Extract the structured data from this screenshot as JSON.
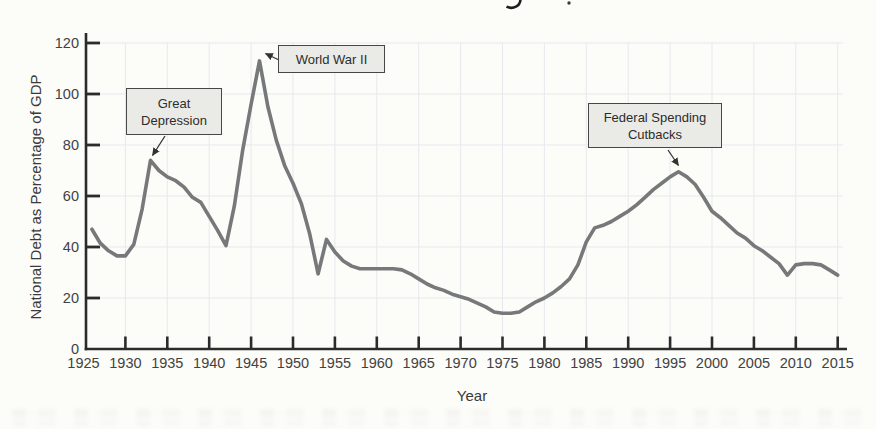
{
  "chart_data": {
    "type": "line",
    "title": "",
    "xlabel": "Year",
    "ylabel": "National Debt as Percentage of GDP",
    "x_ticks": [
      1925,
      1930,
      1935,
      1940,
      1945,
      1950,
      1955,
      1960,
      1965,
      1970,
      1975,
      1980,
      1985,
      1990,
      1995,
      2000,
      2005,
      2010,
      2015
    ],
    "y_ticks": [
      0,
      20,
      40,
      60,
      80,
      100,
      120
    ],
    "xlim": [
      1925,
      2016
    ],
    "ylim": [
      0,
      120
    ],
    "grid": true,
    "legend": "none",
    "series": [
      {
        "name": "National Debt as Percentage of GDP",
        "points": [
          [
            1926,
            47
          ],
          [
            1927,
            41.5
          ],
          [
            1928,
            38.5
          ],
          [
            1929,
            36.5
          ],
          [
            1930,
            36.5
          ],
          [
            1931,
            41
          ],
          [
            1932,
            55
          ],
          [
            1933,
            74
          ],
          [
            1934,
            70
          ],
          [
            1935,
            67.5
          ],
          [
            1936,
            66
          ],
          [
            1937,
            63.5
          ],
          [
            1938,
            59.5
          ],
          [
            1939,
            57.5
          ],
          [
            1940,
            52
          ],
          [
            1941,
            46.5
          ],
          [
            1942,
            40.5
          ],
          [
            1943,
            56
          ],
          [
            1944,
            78
          ],
          [
            1945,
            96
          ],
          [
            1946,
            113
          ],
          [
            1947,
            95
          ],
          [
            1948,
            82
          ],
          [
            1949,
            72
          ],
          [
            1950,
            65
          ],
          [
            1951,
            57
          ],
          [
            1952,
            45
          ],
          [
            1953,
            29.5
          ],
          [
            1954,
            43
          ],
          [
            1955,
            38
          ],
          [
            1956,
            34.5
          ],
          [
            1957,
            32.5
          ],
          [
            1958,
            31.5
          ],
          [
            1959,
            31.5
          ],
          [
            1960,
            31.5
          ],
          [
            1961,
            31.5
          ],
          [
            1962,
            31.5
          ],
          [
            1963,
            31
          ],
          [
            1964,
            29.5
          ],
          [
            1965,
            27.5
          ],
          [
            1966,
            25.5
          ],
          [
            1967,
            24
          ],
          [
            1968,
            23
          ],
          [
            1969,
            21.5
          ],
          [
            1970,
            20.5
          ],
          [
            1971,
            19.5
          ],
          [
            1972,
            18
          ],
          [
            1973,
            16.5
          ],
          [
            1974,
            14.5
          ],
          [
            1975,
            14
          ],
          [
            1976,
            14
          ],
          [
            1977,
            14.5
          ],
          [
            1978,
            16.5
          ],
          [
            1979,
            18.5
          ],
          [
            1980,
            20
          ],
          [
            1981,
            22
          ],
          [
            1982,
            24.5
          ],
          [
            1983,
            27.5
          ],
          [
            1984,
            33
          ],
          [
            1985,
            42
          ],
          [
            1986,
            47.5
          ],
          [
            1987,
            48.5
          ],
          [
            1988,
            50
          ],
          [
            1989,
            52
          ],
          [
            1990,
            54
          ],
          [
            1991,
            56.5
          ],
          [
            1992,
            59.5
          ],
          [
            1993,
            62.5
          ],
          [
            1994,
            65
          ],
          [
            1995,
            67.5
          ],
          [
            1996,
            69.5
          ],
          [
            1997,
            67.5
          ],
          [
            1998,
            64.5
          ],
          [
            1999,
            59.5
          ],
          [
            2000,
            54
          ],
          [
            2001,
            51.5
          ],
          [
            2002,
            48.5
          ],
          [
            2003,
            45.5
          ],
          [
            2004,
            43.5
          ],
          [
            2005,
            40.5
          ],
          [
            2006,
            38.5
          ],
          [
            2007,
            36
          ],
          [
            2008,
            33.5
          ],
          [
            2009,
            29
          ],
          [
            2010,
            33
          ],
          [
            2011,
            33.5
          ],
          [
            2012,
            33.5
          ],
          [
            2013,
            33
          ],
          [
            2014,
            31
          ],
          [
            2015,
            29
          ]
        ]
      }
    ],
    "annotations": [
      {
        "label": "Great Depression",
        "lines": [
          "Great",
          "Depression"
        ],
        "target_year": 1933,
        "target_value": 74
      },
      {
        "label": "World War II",
        "lines": [
          "World War II"
        ],
        "target_year": 1946,
        "target_value": 113
      },
      {
        "label": "Federal Spending Cutbacks",
        "lines": [
          "Federal Spending",
          "Cutbacks"
        ],
        "target_year": 1996,
        "target_value": 69.5
      }
    ],
    "colors": {
      "line": "#76787a",
      "axis": "#2b2b2b",
      "grid": "#e8e9ee",
      "tick_text": "#424242",
      "annotation_fill": "#eaeae7",
      "annotation_border": "#474747",
      "background": "#fcfcf9",
      "arrow": "#333333"
    }
  }
}
